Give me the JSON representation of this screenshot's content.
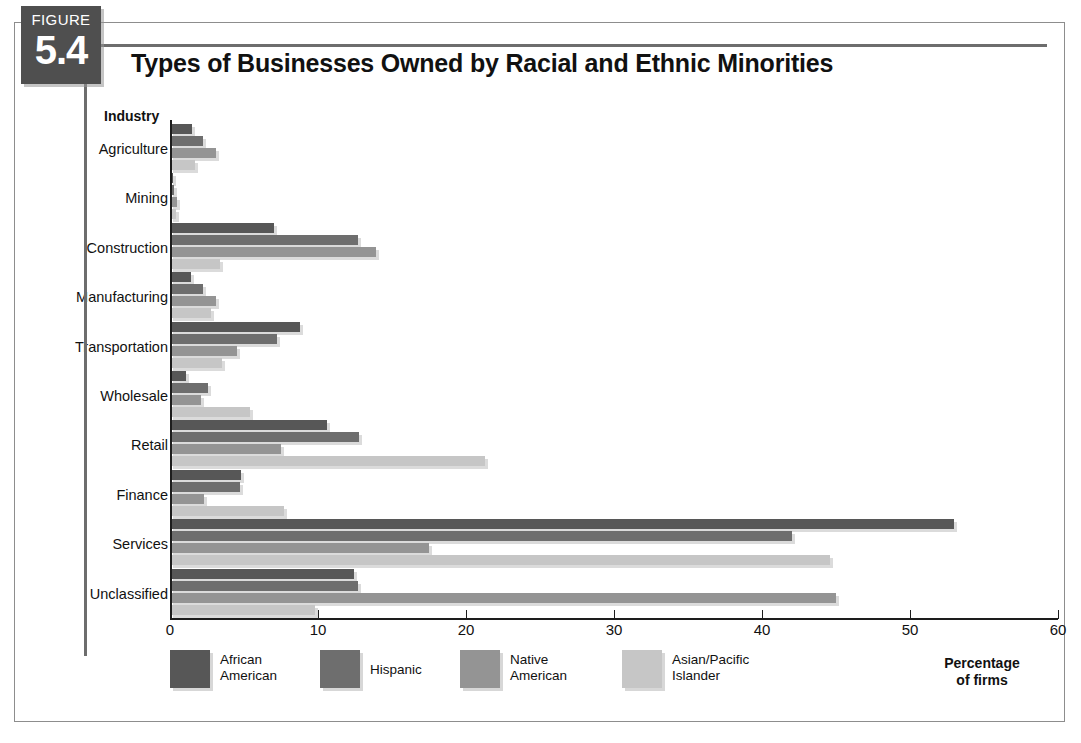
{
  "figure": {
    "badge_word": "FIGURE",
    "badge_number": "5.4",
    "title": "Types of Businesses Owned by Racial and Ethnic Minorities"
  },
  "axis_header": "Industry",
  "axis_title_line1": "Percentage",
  "axis_title_line2": "of firms",
  "colors": {
    "series1": "#575757",
    "series2": "#6e6e6e",
    "series3": "#949494",
    "series4": "#c6c6c6",
    "badge": "#4f4f4f",
    "rule": "#6d6d6d",
    "axis": "#1d1d1d"
  },
  "chart_data": {
    "type": "bar",
    "orientation": "horizontal",
    "title": "Types of Businesses Owned by Racial and Ethnic Minorities",
    "xlabel": "Percentage of firms",
    "ylabel": "Industry",
    "xlim": [
      0,
      60
    ],
    "xticks": [
      0,
      10,
      20,
      30,
      40,
      50,
      60
    ],
    "grid": false,
    "legend_position": "bottom",
    "categories": [
      "Agriculture",
      "Mining",
      "Construction",
      "Manufacturing",
      "Transportation",
      "Wholesale",
      "Retail",
      "Finance",
      "Services",
      "Unclassified"
    ],
    "series": [
      {
        "name": "African American",
        "color": "#575757",
        "values": [
          1.5,
          0.2,
          7.0,
          1.4,
          8.8,
          1.1,
          10.6,
          4.8,
          53.0,
          12.4
        ]
      },
      {
        "name": "Hispanic",
        "color": "#6e6e6e",
        "values": [
          2.2,
          0.3,
          12.7,
          2.2,
          7.2,
          2.6,
          12.8,
          4.7,
          42.0,
          12.7
        ]
      },
      {
        "name": "Native American",
        "color": "#949494",
        "values": [
          3.1,
          0.5,
          13.9,
          3.1,
          4.5,
          2.1,
          7.5,
          2.3,
          17.5,
          45.0
        ]
      },
      {
        "name": "Asian/Pacific Islander",
        "color": "#c6c6c6",
        "values": [
          1.7,
          0.4,
          3.4,
          2.8,
          3.5,
          5.4,
          21.3,
          7.7,
          44.6,
          9.8
        ]
      }
    ]
  },
  "legend": [
    {
      "label_line1": "African",
      "label_line2": "American",
      "color": "#575757"
    },
    {
      "label_line1": "Hispanic",
      "label_line2": "",
      "color": "#6e6e6e"
    },
    {
      "label_line1": "Native",
      "label_line2": "American",
      "color": "#949494"
    },
    {
      "label_line1": "Asian/Pacific",
      "label_line2": "Islander",
      "color": "#c6c6c6"
    }
  ]
}
